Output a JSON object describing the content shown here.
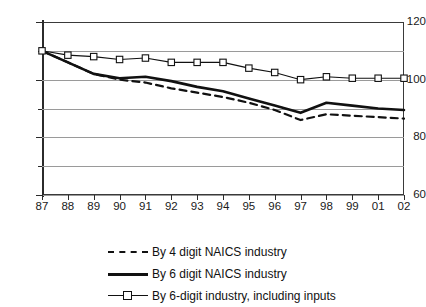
{
  "chart_data": {
    "type": "line",
    "title": "",
    "subtitle": "",
    "xlabel": "",
    "ylabel": "",
    "grid": true,
    "legend_position": "bottom",
    "x": [
      "87",
      "88",
      "89",
      "90",
      "91",
      "92",
      "93",
      "94",
      "95",
      "96",
      "97",
      "98",
      "99",
      "01",
      "02"
    ],
    "categories": [
      "87",
      "88",
      "89",
      "90",
      "91",
      "92",
      "93",
      "94",
      "95",
      "96",
      "97",
      "98",
      "99",
      "01",
      "02"
    ],
    "xlim": [
      0,
      14
    ],
    "ylim": [
      60,
      120
    ],
    "ytick_labels": [
      "120",
      "100",
      "80",
      "60"
    ],
    "ytick_values": [
      120,
      100,
      80,
      60
    ],
    "yminor_values": [
      110,
      90,
      70
    ],
    "series": [
      {
        "name": "By 4 digit NAICS industry",
        "style": "dashed",
        "marker": "none",
        "color": "#111111",
        "values": [
          110,
          106,
          102,
          100,
          99,
          97,
          95.5,
          94,
          92,
          89.5,
          86,
          88,
          87.5,
          87,
          86.5
        ]
      },
      {
        "name": "By 6 digit NAICS industry",
        "style": "solid",
        "marker": "none",
        "color": "#111111",
        "values": [
          110,
          106,
          102,
          100.5,
          101,
          99.5,
          97.5,
          96,
          93.5,
          91,
          88.5,
          92,
          91,
          90,
          89.5
        ]
      },
      {
        "name": "By 6-digit industry, including inputs",
        "style": "solid-thin",
        "marker": "square",
        "color": "#111111",
        "values": [
          110,
          108.5,
          108,
          107,
          107.5,
          106,
          106,
          106,
          104,
          102.5,
          100,
          101,
          100.5,
          100.5,
          100.5
        ]
      }
    ]
  },
  "legend": {
    "items": [
      {
        "label": "By 4 digit NAICS industry"
      },
      {
        "label": "By 6 digit NAICS industry"
      },
      {
        "label": "By 6-digit industry, including inputs"
      }
    ]
  }
}
